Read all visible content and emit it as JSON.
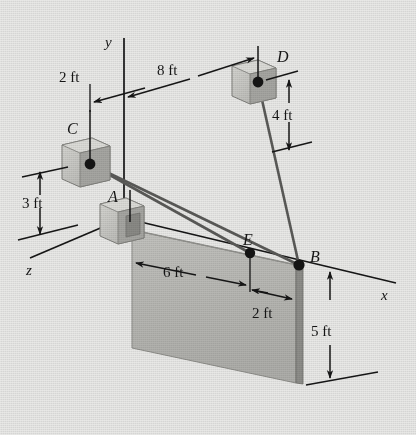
{
  "figure": {
    "type": "statics-free-body-diagram",
    "background_color": "#e9e9e7",
    "line_color": "#161616",
    "plate_fill": "#b9b9b5",
    "plate_edge_fill": "#8e8e8a",
    "block_fill": "#c9c9c5",
    "block_shade": "#a3a39f"
  },
  "axes": [
    {
      "name": "y-axis",
      "label": "y"
    },
    {
      "name": "x-axis",
      "label": "x"
    },
    {
      "name": "z-axis",
      "label": "z"
    }
  ],
  "points": [
    {
      "name": "point-a",
      "label": "A"
    },
    {
      "name": "point-b",
      "label": "B"
    },
    {
      "name": "point-c",
      "label": "C"
    },
    {
      "name": "point-d",
      "label": "D"
    },
    {
      "name": "point-e",
      "label": "E"
    }
  ],
  "dimensions": [
    {
      "name": "dim-2ft-top",
      "label": "2 ft"
    },
    {
      "name": "dim-8ft",
      "label": "8 ft"
    },
    {
      "name": "dim-4ft",
      "label": "4 ft"
    },
    {
      "name": "dim-3ft",
      "label": "3 ft"
    },
    {
      "name": "dim-6ft",
      "label": "6 ft"
    },
    {
      "name": "dim-2ft-plate",
      "label": "2 ft"
    },
    {
      "name": "dim-5ft",
      "label": "5 ft"
    }
  ]
}
